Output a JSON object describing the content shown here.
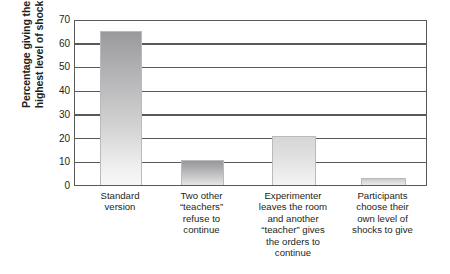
{
  "chart_data": {
    "type": "bar",
    "title": "",
    "xlabel": "",
    "ylabel_lines": [
      "Percentage giving the",
      "highest level of shock"
    ],
    "ylabel": "Percentage giving the highest level of shock",
    "ylim": [
      0,
      70
    ],
    "ytick_values": [
      70,
      60,
      50,
      40,
      30,
      20,
      10,
      0
    ],
    "ytick_labels": [
      "70",
      "60",
      "50",
      "40",
      "30",
      "20",
      "10",
      "0"
    ],
    "grid": true,
    "grid_axis": "y",
    "legend": false,
    "categories": [
      "Standard version",
      "Two other \"teachers\" refuse to continue",
      "Experimenter leaves the room and another \"teacher\" gives the orders to continue",
      "Participants choose their own level of shocks to give"
    ],
    "category_label_lines": [
      [
        "Standard",
        "version"
      ],
      [
        "Two other",
        "“teachers”",
        "refuse to",
        "continue"
      ],
      [
        "Experimenter",
        "leaves the room",
        "and another",
        "“teacher” gives",
        "the orders to",
        "continue"
      ],
      [
        "Participants",
        "choose their",
        "own level of",
        "shocks to give"
      ]
    ],
    "values": [
      65,
      10.5,
      20.5,
      3
    ],
    "bar_colors": [
      "#b4b4b6",
      "#b0b0b2",
      "#e0e0e1",
      "#dcdcdd"
    ],
    "bar_edge_color": "#b9babc",
    "axis_color": "#58595b",
    "background_color": "#ffffff",
    "text_color": "#231f20"
  }
}
